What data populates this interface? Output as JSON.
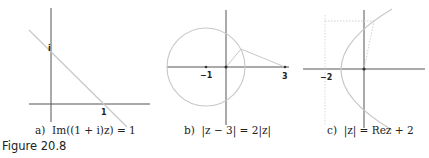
{
  "figure": {
    "label": "Figure 20.8",
    "panels": [
      {
        "id": "a",
        "caption_prefix": "a)",
        "caption_math": "Im((1 + i)z) = 1",
        "labels": [
          "i",
          "1"
        ],
        "description": "Straight line through i and 1 on the complex plane"
      },
      {
        "id": "b",
        "caption_prefix": "b)",
        "caption_math": "|z − 3| = 2|z|",
        "labels": [
          "−1",
          "3"
        ],
        "description": "Circle centered at −1 with radius 2; segments from origin and from 3 to a point on the circle"
      },
      {
        "id": "c",
        "caption_prefix": "c)",
        "caption_math": "|z| = Rez + 2",
        "labels": [
          "−2"
        ],
        "description": "Parabola with focus at origin and directrix Re z = −2; dotted construction lines"
      }
    ]
  },
  "colors": {
    "axis": "#444444",
    "curve": "#c8c8c8",
    "text": "#222222"
  }
}
